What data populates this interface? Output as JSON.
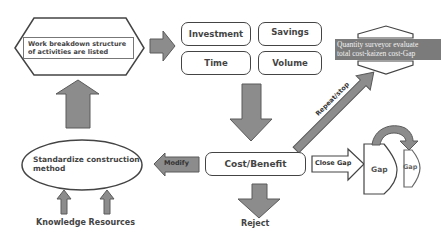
{
  "diagram": {
    "wbs": {
      "text_line1": "Work breakdown structure",
      "text_line2": "of  activities are listed"
    },
    "factors": {
      "investment": "Investment",
      "savings": "Savings",
      "time": "Time",
      "volume": "Volume"
    },
    "quantity_surveyor": {
      "line1": "Quantity surveyor evaluate",
      "line2": "total cost-kaizen cost-Gap"
    },
    "cost_benefit": "Cost/Benefit",
    "standardize": {
      "line1": "Standardize  construction",
      "line2": "method"
    },
    "knowledge_resources": "Knowledge Resources",
    "reject": "Reject",
    "arrows": {
      "modify": "Modify",
      "close_gap": "Close Gap",
      "repeat_stop": "Repeat/stop"
    },
    "gap_large": "Gap",
    "gap_small": "Gap",
    "colors": {
      "arrow_fill": "#8c8c8c",
      "arrow_stroke": "#5a5a5a",
      "outline": "#444444",
      "qs_label_bg": "#7b7b7b"
    }
  }
}
